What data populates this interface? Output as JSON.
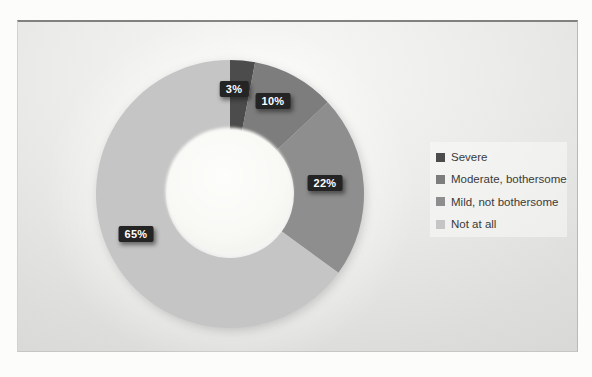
{
  "chart_data": {
    "type": "pie",
    "subtype": "donut",
    "title": "",
    "categories": [
      "Severe",
      "Moderate, bothersome",
      "Mild, not bothersome",
      "Not at all"
    ],
    "values": [
      3,
      10,
      22,
      65
    ],
    "data_labels": [
      "3%",
      "10%",
      "22%",
      "65%"
    ],
    "series_colors": [
      "#4c4c4c",
      "#7d7d7d",
      "#8e8e8e",
      "#c5c5c5"
    ],
    "start_angle_deg": 0,
    "direction": "clockwise",
    "hole_ratio": 0.48,
    "legend_position": "right",
    "grid": false,
    "label_style": {
      "background": "#242424",
      "text_color": "#ffffff"
    }
  },
  "legend": {
    "items": [
      {
        "label": "Severe",
        "color": "#4c4c4c"
      },
      {
        "label": "Moderate, bothersome",
        "color": "#7d7d7d"
      },
      {
        "label": "Mild, not bothersome",
        "color": "#8e8e8e"
      },
      {
        "label": "Not at all",
        "color": "#c5c5c5"
      }
    ]
  }
}
